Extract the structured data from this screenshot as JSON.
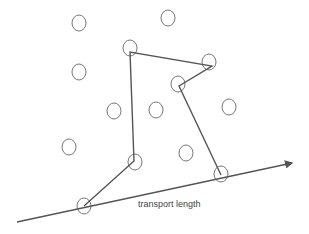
{
  "diagram": {
    "caption": "transport length",
    "stroke_color": "#555555",
    "circle_color": "#777777",
    "circles": [
      {
        "cx": 79,
        "cy": 23
      },
      {
        "cx": 168,
        "cy": 18
      },
      {
        "cx": 130,
        "cy": 48
      },
      {
        "cx": 79,
        "cy": 72
      },
      {
        "cx": 209,
        "cy": 62
      },
      {
        "cx": 178,
        "cy": 84
      },
      {
        "cx": 114,
        "cy": 111
      },
      {
        "cx": 156,
        "cy": 110
      },
      {
        "cx": 229,
        "cy": 107
      },
      {
        "cx": 69,
        "cy": 147
      },
      {
        "cx": 135,
        "cy": 162
      },
      {
        "cx": 186,
        "cy": 153
      },
      {
        "cx": 84,
        "cy": 206
      },
      {
        "cx": 221,
        "cy": 174
      }
    ],
    "path": [
      [
        84,
        206
      ],
      [
        134,
        161
      ],
      [
        130,
        52
      ],
      [
        212,
        66
      ],
      [
        179,
        86
      ],
      [
        221,
        175
      ]
    ],
    "axis": {
      "x1": 17,
      "y1": 222,
      "x2": 292,
      "y2": 163
    }
  }
}
